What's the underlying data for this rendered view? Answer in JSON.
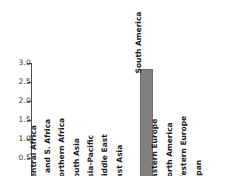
{
  "chart_data": {
    "type": "bar",
    "title": "",
    "subtitle": "",
    "xlabel": "",
    "ylabel": "",
    "categories": [
      "Central Africa",
      "E. and S. Africa",
      "Northern Africa",
      "South Asia",
      "Asia-Pacific",
      "Middle East",
      "East Asia",
      "South America",
      "Eastern Europe",
      "North America",
      "Western Europe",
      "Japan"
    ],
    "values": [
      0,
      0,
      0,
      0,
      0,
      0,
      0,
      2.85,
      0,
      0,
      0,
      0
    ],
    "ylim": [
      0,
      3.0
    ],
    "yticks": [
      "0.5",
      "1.0",
      "1.5",
      "2.0",
      "2.5",
      "3.0"
    ],
    "ytick_values": [
      0.5,
      1.0,
      1.5,
      2.0,
      2.5,
      3.0
    ],
    "grid": false,
    "legend": null,
    "bar_color": "#808080",
    "bar_edge_color": "#6b6b6b",
    "axis_color": "#4d4d4d",
    "background": "#ffffff"
  },
  "axis": {
    "y_tick_labels": [
      "3.0",
      "2.5",
      "2.0",
      "1.5",
      "1.0",
      "0.5"
    ]
  },
  "categories_labels": {
    "c0": "Central Africa",
    "c1": "E. and S. Africa",
    "c2": "Northern Africa",
    "c3": "South Asia",
    "c4": "Asia-Pacific",
    "c5": "Middle East",
    "c6": "East Asia",
    "c7": "South America",
    "c8": "Eastern Europe",
    "c9": "North America",
    "c10": "Western Europe",
    "c11": "Japan"
  }
}
